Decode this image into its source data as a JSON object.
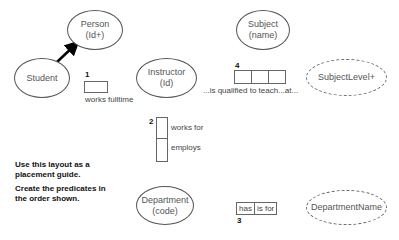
{
  "diagram": {
    "entities": [
      {
        "id": "person",
        "name": "Person",
        "refmode": "(Id+)",
        "style": "solid"
      },
      {
        "id": "student",
        "name": "Student",
        "refmode": "",
        "style": "solid"
      },
      {
        "id": "instructor",
        "name": "Instructor",
        "refmode": "(Id)",
        "style": "solid"
      },
      {
        "id": "subject",
        "name": "Subject",
        "refmode": "(name)",
        "style": "solid"
      },
      {
        "id": "department",
        "name": "Department",
        "refmode": "(code)",
        "style": "solid"
      }
    ],
    "value_types": [
      {
        "id": "subjectlevel",
        "name": "SubjectLevel+",
        "style": "dashed"
      },
      {
        "id": "departmentname",
        "name": "DepartmentName",
        "style": "dashed"
      }
    ],
    "subtype_arrow": {
      "from": "Student",
      "to": "Person"
    },
    "predicates": [
      {
        "number": "1",
        "roles": 1,
        "reading": "works fulltime"
      },
      {
        "number": "2",
        "roles": 2,
        "readings": [
          "works for",
          "employs"
        ]
      },
      {
        "number": "3",
        "roles": 2,
        "cells": [
          "has",
          "is for"
        ]
      },
      {
        "number": "4",
        "roles": 3,
        "reading": "...is qualified to teach...at..."
      }
    ]
  },
  "instructions": {
    "line1": "Use this layout as a placement guide.",
    "line2": "Create the predicates in the order shown."
  },
  "colors": {
    "stroke": "#555555",
    "arrow": "#000000",
    "background": "#ffffff"
  }
}
